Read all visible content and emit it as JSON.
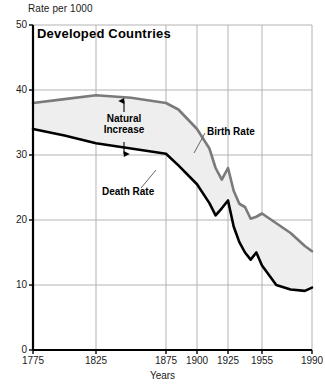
{
  "chart_data": {
    "type": "line",
    "title": "Developed Countries",
    "xlabel": "Years",
    "ylabel": "Rate per 1000",
    "ylim": [
      0,
      50
    ],
    "xlim": [
      1775,
      1990
    ],
    "grid": true,
    "legend_position": "inline-annotations",
    "ytick_labels": [
      "50",
      "40",
      "30",
      "20",
      "10",
      "0"
    ],
    "ytick_values": [
      50,
      40,
      30,
      20,
      10,
      0
    ],
    "xtick_labels": [
      "1775",
      "1825",
      "1875",
      "1900",
      "1925",
      "1955",
      "1990"
    ],
    "xtick_values": [
      1775,
      1825,
      1875,
      1900,
      1925,
      1955,
      1990
    ],
    "series": [
      {
        "name": "Birth Rate",
        "color": "#7a7a7a",
        "x": [
          1775,
          1800,
          1825,
          1850,
          1875,
          1885,
          1900,
          1910,
          1915,
          1920,
          1925,
          1930,
          1935,
          1940,
          1945,
          1950,
          1955,
          1965,
          1975,
          1985,
          1990
        ],
        "y": [
          38.0,
          38.6,
          39.2,
          38.8,
          38.0,
          37.0,
          34.0,
          31.0,
          28.0,
          26.2,
          28.0,
          24.5,
          22.5,
          22.0,
          20.2,
          20.5,
          21.0,
          19.5,
          18.0,
          16.0,
          15.2
        ]
      },
      {
        "name": "Death Rate",
        "color": "#000000",
        "x": [
          1775,
          1800,
          1825,
          1850,
          1875,
          1885,
          1900,
          1910,
          1915,
          1920,
          1925,
          1930,
          1935,
          1940,
          1945,
          1950,
          1955,
          1965,
          1975,
          1985,
          1990
        ],
        "y": [
          34.0,
          33.0,
          31.8,
          31.0,
          30.2,
          28.4,
          25.5,
          22.6,
          20.7,
          21.8,
          23.0,
          19.0,
          16.6,
          15.0,
          13.9,
          15.0,
          13.0,
          10.0,
          9.3,
          9.1,
          9.6
        ]
      }
    ],
    "band": {
      "name": "Natural Increase",
      "fill_color": "#eeeeee",
      "between": [
        "Birth Rate",
        "Death Rate"
      ]
    },
    "annotations": [
      {
        "name": "natural-increase",
        "text_line1": "Natural",
        "text_line2": "Increase",
        "kind": "double-arrow-label"
      },
      {
        "name": "birth-rate",
        "text": "Birth Rate",
        "kind": "leader-label"
      },
      {
        "name": "death-rate",
        "text": "Death Rate",
        "kind": "leader-label"
      }
    ]
  },
  "axis": {
    "y_axis_caption": "Rate per 1000",
    "x_axis_caption": "Years"
  },
  "title": {
    "text": "Developed Countries"
  },
  "labels": {
    "natural_increase_1": "Natural",
    "natural_increase_2": "Increase",
    "birth_rate": "Birth Rate",
    "death_rate": "Death Rate"
  },
  "yticks": [
    {
      "label": "50"
    },
    {
      "label": "40"
    },
    {
      "label": "30"
    },
    {
      "label": "20"
    },
    {
      "label": "10"
    },
    {
      "label": "0"
    }
  ],
  "xticks": [
    {
      "label": "1775"
    },
    {
      "label": "1825"
    },
    {
      "label": "1875"
    },
    {
      "label": "1900"
    },
    {
      "label": "1925"
    },
    {
      "label": "1955"
    },
    {
      "label": "1990"
    }
  ],
  "colors": {
    "birth_rate": "#7a7a7a",
    "death_rate": "#000000",
    "band_fill": "#eeeeee",
    "grid": "#b3b3b3",
    "axis": "#000000"
  }
}
